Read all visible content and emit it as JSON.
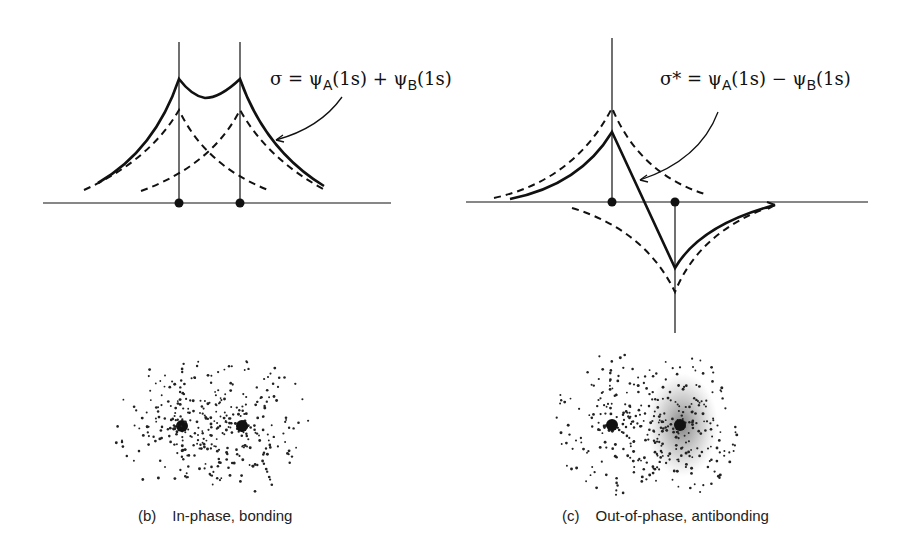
{
  "bonding": {
    "equation": {
      "lhs": "σ",
      "eq": " = ",
      "psi_a": "ψ",
      "sub_a": "A",
      "orb_a": "(1s)",
      "op": " + ",
      "psi_b": "ψ",
      "sub_b": "B",
      "orb_b": "(1s)"
    },
    "caption": {
      "tag": "(b)",
      "text": "In-phase, bonding"
    }
  },
  "antibonding": {
    "equation": {
      "lhs": "σ*",
      "eq": " = ",
      "psi_a": "ψ",
      "sub_a": "A",
      "orb_a": "(1s)",
      "op": " − ",
      "psi_b": "ψ",
      "sub_b": "B",
      "orb_b": "(1s)"
    },
    "caption": {
      "tag": "(c)",
      "text": "Out-of-phase, antibonding"
    }
  },
  "colors": {
    "ink": "#111111",
    "background": "#ffffff"
  }
}
